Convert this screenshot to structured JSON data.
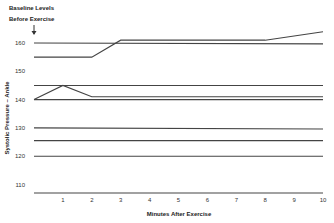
{
  "chart_data": {
    "type": "line",
    "title": "",
    "annotation": [
      "Baseline Levels",
      "Before Exercise"
    ],
    "annotation_arrow": "down-arrow-icon",
    "xlabel": "Minutes After Exercise",
    "ylabel": "Systolic Pressure – Ankle",
    "xlim": [
      0,
      10
    ],
    "ylim": [
      107,
      165
    ],
    "x_ticks": [
      1,
      2,
      3,
      4,
      5,
      6,
      7,
      8,
      9,
      10
    ],
    "x_tick_labels": [
      "1",
      "2",
      "3",
      "4",
      "5",
      "6",
      "7",
      "8",
      "9",
      "10"
    ],
    "y_ticks": [
      160,
      150,
      140,
      130,
      120,
      110
    ],
    "y_tick_labels": [
      "160",
      "150",
      "140",
      "130",
      "120",
      "110"
    ],
    "grid": false,
    "legend": "none",
    "line_color": "#444444",
    "series": [
      {
        "name": "subject-1",
        "x": [
          0,
          10
        ],
        "values": [
          160,
          159.7
        ]
      },
      {
        "name": "subject-2",
        "x": [
          0,
          2,
          3,
          8,
          10
        ],
        "values": [
          155,
          155,
          161,
          161,
          164
        ]
      },
      {
        "name": "subject-3",
        "x": [
          0,
          10
        ],
        "values": [
          145,
          145
        ]
      },
      {
        "name": "subject-4",
        "x": [
          0,
          1,
          2,
          10
        ],
        "values": [
          140,
          145,
          141,
          141
        ]
      },
      {
        "name": "subject-5",
        "x": [
          0,
          10
        ],
        "values": [
          140,
          140
        ]
      },
      {
        "name": "subject-6",
        "x": [
          0,
          10
        ],
        "values": [
          130,
          129.6
        ]
      },
      {
        "name": "subject-7",
        "x": [
          0,
          10
        ],
        "values": [
          125.5,
          125.5
        ]
      },
      {
        "name": "subject-8",
        "x": [
          0,
          10
        ],
        "values": [
          120,
          120
        ]
      },
      {
        "name": "subject-9",
        "x": [
          0,
          10
        ],
        "values": [
          107,
          107
        ]
      }
    ]
  }
}
